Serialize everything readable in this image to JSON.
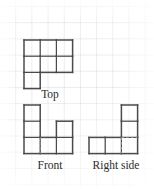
{
  "figure": {
    "kind": "orthographic-views-on-grid",
    "background_color": "#ffffff",
    "grid_color": "#c3c9d6",
    "outline_color": "#4a4a4a",
    "hidden_edge_color": "#8d8d8d",
    "label_color": "#2b2b2b",
    "cell_size_px": 16.2
  },
  "views": {
    "top": {
      "label": "Top",
      "origin": {
        "x": 24,
        "y": 40
      },
      "cells": [
        {
          "col": 0,
          "row": 0
        },
        {
          "col": 1,
          "row": 0
        },
        {
          "col": 2,
          "row": 0
        },
        {
          "col": 0,
          "row": 1
        },
        {
          "col": 1,
          "row": 1
        },
        {
          "col": 2,
          "row": 1
        },
        {
          "col": 0,
          "row": 2
        }
      ],
      "cols": 3,
      "rows": 3,
      "hidden_edges": []
    },
    "front": {
      "label": "Front",
      "origin": {
        "x": 24,
        "y": 105
      },
      "cells": [
        {
          "col": 0,
          "row": 0
        },
        {
          "col": 0,
          "row": 1
        },
        {
          "col": 2,
          "row": 1
        },
        {
          "col": 0,
          "row": 2
        },
        {
          "col": 1,
          "row": 2
        },
        {
          "col": 2,
          "row": 2
        }
      ],
      "cols": 3,
      "rows": 3,
      "hidden_edges": [
        {
          "x1": 1,
          "y1": 2,
          "x2": 1,
          "y2": 3
        }
      ]
    },
    "right_side": {
      "label": "Right side",
      "origin": {
        "x": 89,
        "y": 105
      },
      "cells": [
        {
          "col": 2,
          "row": 0
        },
        {
          "col": 2,
          "row": 1
        },
        {
          "col": 0,
          "row": 2
        },
        {
          "col": 1,
          "row": 2
        },
        {
          "col": 2,
          "row": 2
        }
      ],
      "cols": 3,
      "rows": 3,
      "hidden_edges": [
        {
          "x1": 2,
          "y1": 2,
          "x2": 3,
          "y2": 2
        },
        {
          "x1": 2,
          "y1": 2,
          "x2": 2,
          "y2": 3
        }
      ]
    }
  }
}
